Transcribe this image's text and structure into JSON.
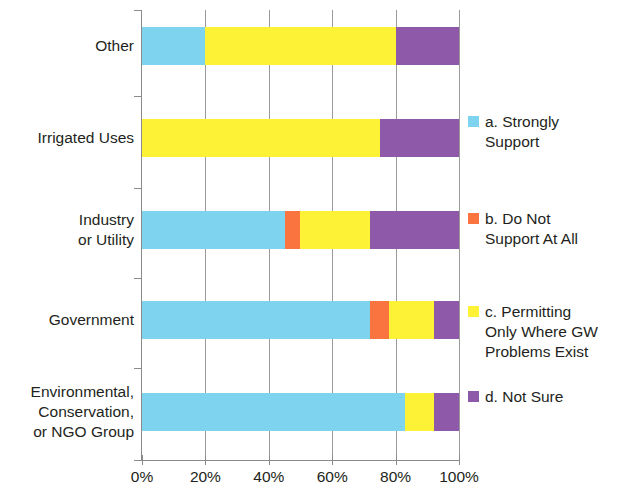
{
  "chart_data": {
    "type": "bar",
    "orientation": "horizontal",
    "stacked": true,
    "normalized_percent": true,
    "title": "",
    "subtitle": "",
    "xlabel": "",
    "ylabel": "",
    "xlim": [
      0,
      100
    ],
    "xticks": [
      "0%",
      "20%",
      "40%",
      "60%",
      "80%",
      "100%"
    ],
    "xtick_values": [
      0,
      20,
      40,
      60,
      80,
      100
    ],
    "grid": "vertical",
    "legend_position": "right",
    "categories": [
      "Other",
      "Irrigated Uses",
      "Industry\nor Utility",
      "Government",
      "Environmental,\nConservation,\nor NGO Group"
    ],
    "series": [
      {
        "name": "a. Strongly\nSupport",
        "key": "a",
        "color": "#7ed3ef",
        "values": [
          20,
          0,
          45,
          72,
          83
        ]
      },
      {
        "name": "b. Do Not\nSupport At All",
        "key": "b",
        "color": "#f9743f",
        "values": [
          0,
          0,
          5,
          6,
          0
        ]
      },
      {
        "name": "c. Permitting\nOnly Where GW\nProblems Exist",
        "key": "c",
        "color": "#fdf235",
        "values": [
          60,
          75,
          22,
          14,
          9
        ]
      },
      {
        "name": "d. Not Sure",
        "key": "d",
        "color": "#8e59a8",
        "values": [
          20,
          25,
          28,
          8,
          8
        ]
      }
    ]
  },
  "axis": {
    "tick_labels": [
      "0%",
      "20%",
      "40%",
      "60%",
      "80%",
      "100%"
    ]
  },
  "legend": {
    "items": [
      {
        "label": "a. Strongly\nSupport",
        "color": "#7ed3ef"
      },
      {
        "label": "b. Do Not\nSupport At All",
        "color": "#f9743f"
      },
      {
        "label": "c. Permitting\nOnly Where GW\nProblems Exist",
        "color": "#fdf235"
      },
      {
        "label": "d. Not Sure",
        "color": "#8e59a8"
      }
    ]
  },
  "categories": {
    "labels": [
      "Other",
      "Irrigated Uses",
      "Industry\nor Utility",
      "Government",
      "Environmental,\nConservation,\nor NGO Group"
    ]
  }
}
